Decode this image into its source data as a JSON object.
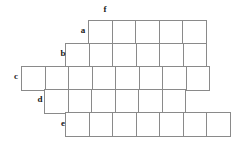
{
  "puzzle": {
    "type": "crossword-style-blank-grid",
    "background_color": "#ffffff",
    "cell_border_color": "#8a8a8a",
    "label_color": "#1a1a1a",
    "cell_size": 23.5,
    "origin_x": 21,
    "origin_y": 20,
    "labels": [
      {
        "text": "f",
        "x": 100,
        "y": 5
      },
      {
        "text": "a",
        "x": 78,
        "y": 26
      },
      {
        "text": "b",
        "x": 58,
        "y": 49
      },
      {
        "text": "c",
        "x": 11,
        "y": 72
      },
      {
        "text": "d",
        "x": 35,
        "y": 95
      },
      {
        "text": "e",
        "x": 58,
        "y": 119
      }
    ],
    "rows": [
      {
        "name": "a",
        "y": 20,
        "x_start": 88,
        "cells": 5
      },
      {
        "name": "b",
        "y": 43,
        "x_start": 65,
        "cells": 6
      },
      {
        "name": "c",
        "y": 66,
        "x_start": 21,
        "cells": 8
      },
      {
        "name": "d",
        "y": 89,
        "x_start": 44,
        "cells": 6
      },
      {
        "name": "e",
        "y": 112,
        "x_start": 65,
        "cells": 7
      }
    ]
  }
}
